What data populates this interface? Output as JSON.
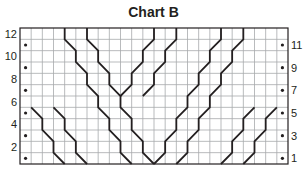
{
  "title": "Chart B",
  "grid": {
    "cols": 24,
    "rows": 12,
    "x0": 20,
    "x1": 288,
    "y0": 28,
    "y1": 164,
    "line_color": "#a7a9ac",
    "border_color": "#231f20"
  },
  "row_labels_left": [
    "12",
    "10",
    "8",
    "6",
    "4",
    "2"
  ],
  "row_labels_right": [
    "11",
    "9",
    "7",
    "5",
    "3",
    "1"
  ],
  "bullet_rows_from_top": [
    1,
    3,
    5,
    7,
    9,
    11
  ],
  "bullet_cols": [
    0,
    23
  ],
  "cable_lines": [
    [
      [
        4,
        0
      ],
      [
        4,
        1
      ],
      [
        5,
        2
      ],
      [
        5,
        3
      ],
      [
        6,
        4
      ],
      [
        6,
        5
      ],
      [
        7,
        6
      ],
      [
        7,
        7
      ],
      [
        8,
        8
      ],
      [
        8,
        9
      ],
      [
        9,
        10
      ],
      [
        9,
        11
      ],
      [
        10,
        12
      ]
    ],
    [
      [
        6,
        0
      ],
      [
        6,
        1
      ],
      [
        7,
        2
      ],
      [
        7,
        3
      ],
      [
        8,
        4
      ],
      [
        8,
        5
      ],
      [
        9,
        6
      ],
      [
        9,
        7
      ],
      [
        10,
        8
      ],
      [
        10,
        9
      ],
      [
        11,
        10
      ],
      [
        11,
        11
      ],
      [
        12,
        12
      ]
    ],
    [
      [
        12,
        0
      ],
      [
        12,
        1
      ],
      [
        11,
        2
      ],
      [
        11,
        3
      ],
      [
        10,
        4
      ],
      [
        10,
        5
      ],
      [
        9,
        6
      ]
    ],
    [
      [
        14,
        0
      ],
      [
        14,
        1
      ],
      [
        13,
        2
      ],
      [
        13,
        3
      ],
      [
        12,
        4
      ],
      [
        12,
        5
      ],
      [
        11,
        6
      ]
    ],
    [
      [
        18,
        0
      ],
      [
        18,
        1
      ],
      [
        17,
        2
      ],
      [
        17,
        3
      ],
      [
        16,
        4
      ],
      [
        16,
        5
      ],
      [
        15,
        6
      ],
      [
        15,
        7
      ],
      [
        14,
        8
      ],
      [
        14,
        9
      ],
      [
        13,
        10
      ],
      [
        13,
        11
      ],
      [
        12,
        12
      ]
    ],
    [
      [
        20,
        0
      ],
      [
        20,
        1
      ],
      [
        19,
        2
      ],
      [
        19,
        3
      ],
      [
        18,
        4
      ],
      [
        18,
        5
      ],
      [
        17,
        6
      ],
      [
        17,
        7
      ],
      [
        16,
        8
      ],
      [
        16,
        9
      ],
      [
        15,
        10
      ],
      [
        15,
        11
      ],
      [
        14,
        12
      ]
    ],
    [
      [
        1,
        7
      ],
      [
        2,
        8
      ],
      [
        2,
        9
      ],
      [
        3,
        10
      ],
      [
        3,
        11
      ],
      [
        4,
        12
      ]
    ],
    [
      [
        3,
        7
      ],
      [
        4,
        8
      ],
      [
        4,
        9
      ],
      [
        5,
        10
      ],
      [
        5,
        11
      ],
      [
        6,
        12
      ]
    ],
    [
      [
        18,
        12
      ],
      [
        19,
        11
      ],
      [
        19,
        10
      ],
      [
        20,
        9
      ],
      [
        20,
        8
      ],
      [
        21,
        7
      ]
    ],
    [
      [
        20,
        12
      ],
      [
        21,
        11
      ],
      [
        21,
        10
      ],
      [
        22,
        9
      ],
      [
        22,
        8
      ],
      [
        23,
        7
      ]
    ]
  ],
  "legend_symbols": {
    "bullet": "purl stitch (dot)",
    "diagonal": "cable crossing line"
  }
}
